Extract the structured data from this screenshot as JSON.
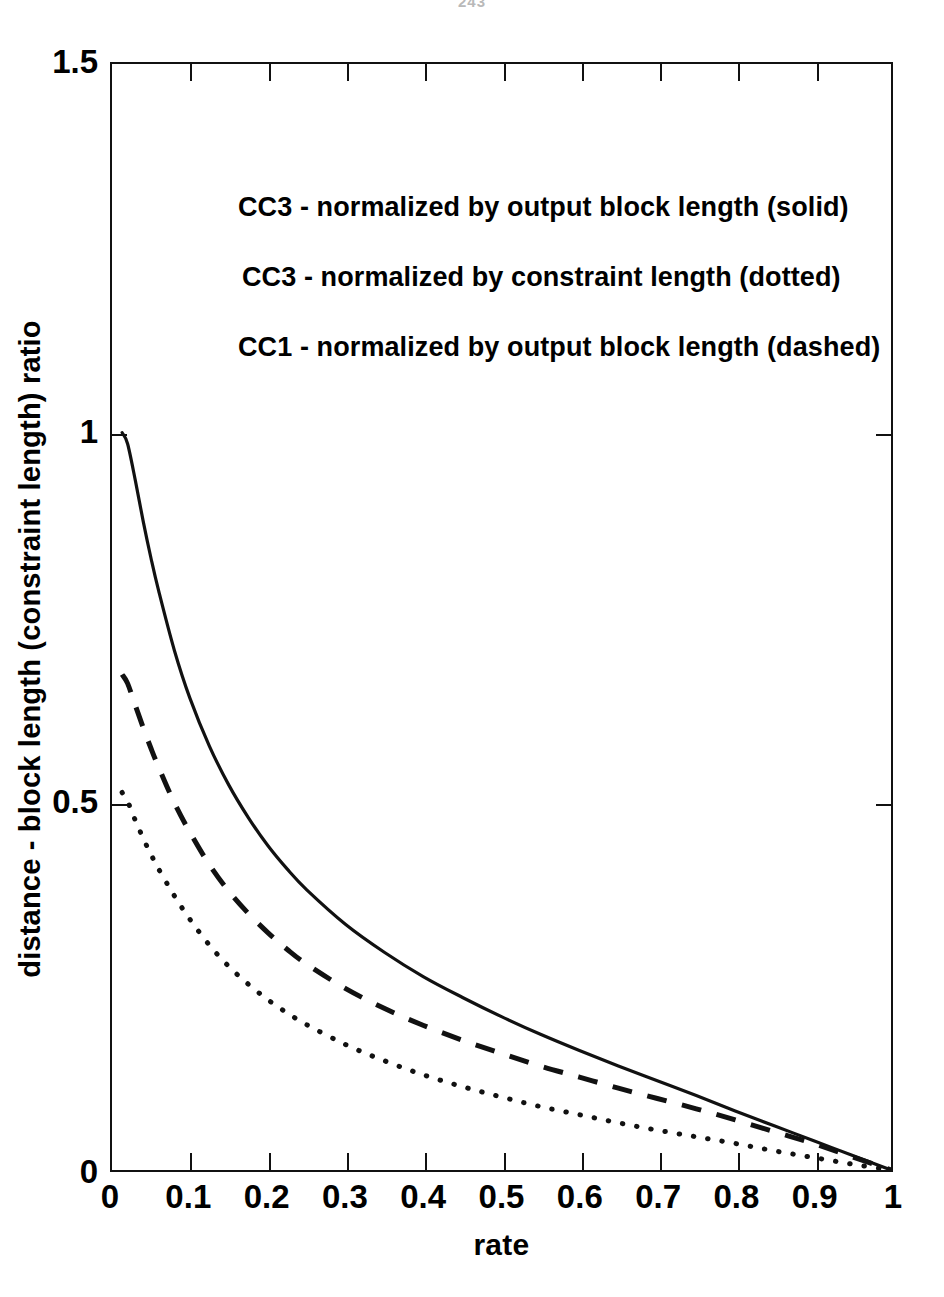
{
  "page": {
    "folio": "243"
  },
  "chart_data": {
    "type": "line",
    "title": "",
    "xlabel": "rate",
    "ylabel": "distance - block length (constraint length) ratio",
    "xlim": [
      0,
      1
    ],
    "ylim": [
      0,
      1.5
    ],
    "grid": false,
    "legend_position": "upper-left-inside",
    "xticks": [
      "0",
      "0.1",
      "0.2",
      "0.3",
      "0.4",
      "0.5",
      "0.6",
      "0.7",
      "0.8",
      "0.9",
      "1"
    ],
    "xtick_values": [
      0,
      0.1,
      0.2,
      0.3,
      0.4,
      0.5,
      0.6,
      0.7,
      0.8,
      0.9,
      1
    ],
    "yticks": [
      "0",
      "0.5",
      "1",
      "1.5"
    ],
    "ytick_values": [
      0,
      0.5,
      1,
      1.5
    ],
    "series": [
      {
        "name": "CC3 - normalized by output block length (solid)",
        "style": "solid",
        "color": "#111111",
        "x": [
          0.013,
          0.02,
          0.03,
          0.04,
          0.05,
          0.06,
          0.08,
          0.1,
          0.125,
          0.15,
          0.175,
          0.2,
          0.225,
          0.25,
          0.3,
          0.35,
          0.4,
          0.45,
          0.5,
          0.55,
          0.6,
          0.65,
          0.7,
          0.75,
          0.8,
          0.85,
          0.9,
          0.95,
          1.0
        ],
        "values": [
          1.0,
          0.985,
          0.935,
          0.88,
          0.83,
          0.785,
          0.705,
          0.64,
          0.575,
          0.522,
          0.478,
          0.44,
          0.408,
          0.38,
          0.333,
          0.295,
          0.262,
          0.234,
          0.208,
          0.184,
          0.162,
          0.141,
          0.121,
          0.101,
          0.08,
          0.06,
          0.04,
          0.02,
          0.0
        ]
      },
      {
        "name": "CC1 - normalized by output block length (dashed)",
        "style": "dashed",
        "color": "#111111",
        "x": [
          0.013,
          0.02,
          0.03,
          0.04,
          0.05,
          0.06,
          0.08,
          0.1,
          0.125,
          0.15,
          0.175,
          0.2,
          0.225,
          0.25,
          0.3,
          0.35,
          0.4,
          0.45,
          0.5,
          0.55,
          0.6,
          0.65,
          0.7,
          0.75,
          0.8,
          0.85,
          0.9,
          0.95,
          1.0
        ],
        "values": [
          0.672,
          0.66,
          0.63,
          0.6,
          0.572,
          0.546,
          0.498,
          0.458,
          0.414,
          0.378,
          0.348,
          0.322,
          0.299,
          0.279,
          0.246,
          0.219,
          0.196,
          0.176,
          0.158,
          0.141,
          0.126,
          0.111,
          0.097,
          0.083,
          0.068,
          0.052,
          0.036,
          0.018,
          0.0
        ]
      },
      {
        "name": "CC3 - normalized by constraint length (dotted)",
        "style": "dotted",
        "color": "#111111",
        "x": [
          0.013,
          0.02,
          0.03,
          0.04,
          0.05,
          0.06,
          0.08,
          0.1,
          0.125,
          0.15,
          0.175,
          0.2,
          0.225,
          0.25,
          0.3,
          0.35,
          0.4,
          0.45,
          0.5,
          0.55,
          0.6,
          0.65,
          0.7,
          0.75,
          0.8,
          0.85,
          0.9,
          0.95,
          1.0
        ],
        "values": [
          0.512,
          0.5,
          0.474,
          0.45,
          0.428,
          0.408,
          0.372,
          0.34,
          0.305,
          0.276,
          0.252,
          0.231,
          0.213,
          0.197,
          0.17,
          0.148,
          0.129,
          0.113,
          0.099,
          0.086,
          0.075,
          0.064,
          0.054,
          0.045,
          0.036,
          0.026,
          0.017,
          0.008,
          0.0
        ]
      }
    ],
    "legend_lines": [
      "CC3 - normalized by output block length (solid)",
      "CC3 - normalized by constraint length (dotted)",
      "CC1 - normalized by output block length (dashed)"
    ]
  }
}
